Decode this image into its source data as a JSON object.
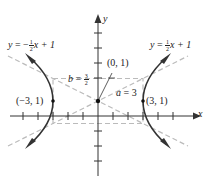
{
  "figure": {
    "type": "hyperbola",
    "equation_center": "(0, 1)",
    "axes": {
      "x_label": "x",
      "y_label": "y"
    },
    "labels": {
      "left_asymptote": {
        "y": "y",
        "eq": "=",
        "neg": "−",
        "num": "1",
        "den": "2",
        "rest": "x + 1"
      },
      "right_asymptote": {
        "y": "y",
        "eq": "=",
        "num": "1",
        "den": "2",
        "rest": "x + 1"
      },
      "center": "(0, 1)",
      "b_label": {
        "var": "b",
        "eq": "=",
        "num": "3",
        "den": "2"
      },
      "a_label": {
        "var": "a",
        "eq": "= 3"
      },
      "left_vertex": "(−3, 1)",
      "right_vertex": "(3, 1)"
    },
    "parameters": {
      "a": 3,
      "b": 1.5,
      "h": 0,
      "k": 1
    },
    "asymptotes": [
      "y = -1/2 x + 1",
      "y = 1/2 x + 1"
    ],
    "vertices": [
      [
        -3,
        1
      ],
      [
        3,
        1
      ]
    ],
    "colors": {
      "curve": "#333333",
      "axis": "#333333",
      "dashed": "#bbbbbb",
      "text": "#222222"
    }
  }
}
